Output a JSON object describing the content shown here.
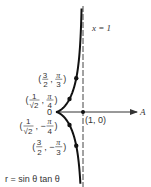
{
  "diagram": {
    "equation": "r = sin θ tan θ",
    "asymptote": {
      "label": "x = 1",
      "x_value": 1
    },
    "polar_axis_label": "A",
    "origin_label": "0",
    "marked_points": [
      {
        "id": "p1",
        "label_r_num": "3",
        "label_r_den": "2",
        "label_theta_sign": "",
        "label_theta_num": "π",
        "label_theta_den": "3",
        "r": 1.5,
        "theta_deg": 60
      },
      {
        "id": "p2",
        "label_r_num": "1",
        "label_r_den": "√2",
        "label_theta_sign": "",
        "label_theta_num": "π",
        "label_theta_den": "4",
        "r": 0.7071,
        "theta_deg": 45
      },
      {
        "id": "p3",
        "label_r_num": "1",
        "label_r_den": "√2",
        "label_theta_sign": "−",
        "label_theta_num": "π",
        "label_theta_den": "4",
        "r": 0.7071,
        "theta_deg": -45
      },
      {
        "id": "p4",
        "label_r_num": "3",
        "label_r_den": "2",
        "label_theta_sign": "−",
        "label_theta_num": "π",
        "label_theta_den": "3",
        "r": 1.5,
        "theta_deg": -60
      }
    ],
    "intercept_point": {
      "label": "(1, 0)",
      "x": 1,
      "y": 0
    },
    "colors": {
      "curve": "#111111",
      "axis": "#333333",
      "asymptote": "#444444",
      "text": "#333333"
    }
  }
}
